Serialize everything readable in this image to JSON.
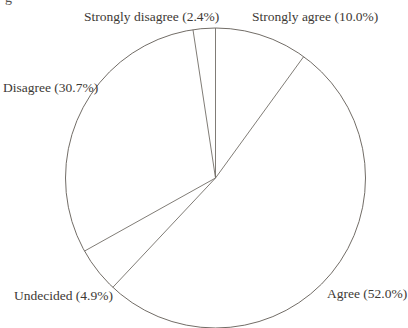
{
  "page": {
    "corner_fragment": "g"
  },
  "chart_data": {
    "type": "pie",
    "title": "",
    "categories": [
      "Strongly disagree",
      "Disagree",
      "Undecided",
      "Agree",
      "Strongly agree"
    ],
    "values": [
      2.4,
      30.7,
      4.9,
      52.0,
      10.0
    ],
    "labels": [
      "Strongly disagree (2.4%)",
      "Disagree (30.7%)",
      "Undecided (4.9%)",
      "Agree (52.0%)",
      "Strongly agree (10.0%)"
    ],
    "start_angle_deg": 90,
    "direction": "counterclockwise",
    "legend": "none",
    "slice_fill": "#ffffff",
    "stroke_color": "#726d67",
    "label_color": "#3d3935"
  }
}
